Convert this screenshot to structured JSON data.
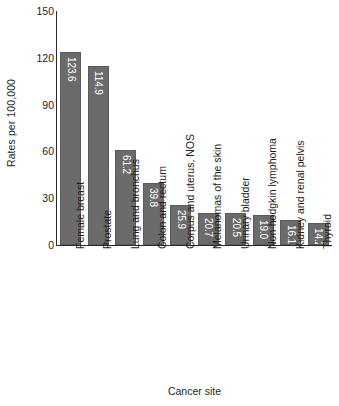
{
  "chart_data": {
    "type": "bar",
    "title": "",
    "subtitle": "",
    "xlabel": "Cancer site",
    "ylabel": "Rates per 100,000",
    "ylim": [
      0,
      150
    ],
    "yticks": [
      0,
      30,
      60,
      90,
      120,
      150
    ],
    "grid": false,
    "legend": null,
    "orientation": "vertical",
    "bar_color": "#6b6b6b",
    "value_label_color": "#ffffff",
    "axis_color": "#2b2b2b",
    "categories": [
      "Female breast",
      "Prostate",
      "Lung and bronchus",
      "Colon and rectum",
      "Corpus and uterus, NOS",
      "Melanomas of the skin",
      "Urinary bladder",
      "Non-hodgkin lymphoma",
      "Kidney and renal pelvis",
      "Thyroid"
    ],
    "values": [
      123.6,
      114.9,
      61.2,
      39.8,
      25.9,
      20.7,
      20.5,
      19.0,
      16.1,
      14.2
    ],
    "value_labels": [
      "123.6",
      "114.9",
      "61.2",
      "39.8",
      "25.9",
      "20.7",
      "20.5",
      "19.0",
      "16.1",
      "14.2"
    ],
    "ytick_labels": [
      "0",
      "30",
      "60",
      "90",
      "120",
      "150"
    ]
  }
}
